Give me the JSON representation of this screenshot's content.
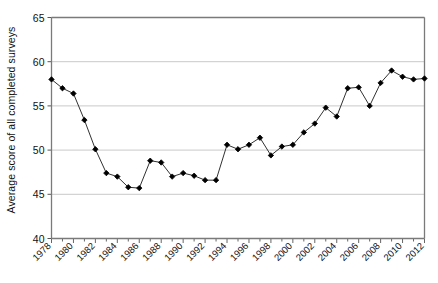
{
  "chart_data": {
    "type": "line",
    "title": "",
    "xlabel": "",
    "ylabel": "Average score of all completed surveys",
    "ylim": [
      40,
      65
    ],
    "xlim": [
      1978,
      2012
    ],
    "yticks": [
      40,
      45,
      50,
      55,
      60,
      65
    ],
    "ytick_labels": [
      "40",
      "45",
      "50",
      "55",
      "60",
      "65"
    ],
    "xticks": [
      1978,
      1980,
      1982,
      1984,
      1986,
      1988,
      1990,
      1992,
      1994,
      1996,
      1998,
      2000,
      2002,
      2004,
      2006,
      2008,
      2010,
      2012
    ],
    "xtick_labels": [
      "1978",
      "1980",
      "1982",
      "1984",
      "1986",
      "1988",
      "1990",
      "1992",
      "1994",
      "1996",
      "1998",
      "2000",
      "2002",
      "2004",
      "2006",
      "2008",
      "2010",
      "2012"
    ],
    "xtick_minor_every": 1,
    "grid": "horizontal",
    "legend": "none",
    "marker": "diamond",
    "line_color": "#1a1a1a",
    "marker_color": "#000000",
    "grid_color": "#c9c9c9",
    "axis_color": "#7a7a7a",
    "x": [
      1978,
      1979,
      1980,
      1981,
      1982,
      1983,
      1984,
      1985,
      1986,
      1987,
      1988,
      1989,
      1990,
      1991,
      1992,
      1993,
      1994,
      1995,
      1996,
      1997,
      1998,
      1999,
      2000,
      2001,
      2002,
      2003,
      2004,
      2005,
      2006,
      2007,
      2008,
      2009,
      2010,
      2011,
      2012
    ],
    "values": [
      58.0,
      57.0,
      56.4,
      53.4,
      50.1,
      47.4,
      47.0,
      45.8,
      45.7,
      48.8,
      48.6,
      47.0,
      47.4,
      47.1,
      46.6,
      46.6,
      50.6,
      50.1,
      50.6,
      51.4,
      49.4,
      50.4,
      50.6,
      52.0,
      53.0,
      54.8,
      53.8,
      57.0,
      57.1,
      55.0,
      57.6,
      59.0,
      58.3,
      58.0,
      58.1
    ]
  }
}
